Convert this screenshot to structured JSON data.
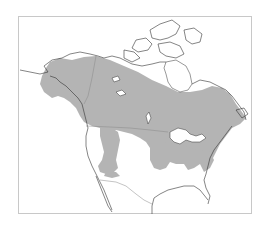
{
  "map": {
    "title": "Species range map of North America",
    "region": "North America",
    "colors": {
      "range_fill": "#b4b4b4",
      "coastline": "#333333",
      "border": "#888888",
      "frame": "#c8c8c8",
      "background": "#ffffff"
    },
    "layers": [
      {
        "name": "coastlines",
        "type": "outline"
      },
      {
        "name": "country-borders",
        "type": "outline"
      },
      {
        "name": "species-range",
        "type": "shaded-area"
      }
    ]
  }
}
